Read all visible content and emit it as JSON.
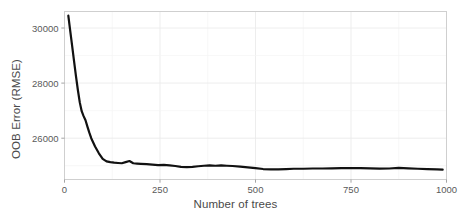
{
  "chart_data": {
    "type": "line",
    "title": "",
    "xlabel": "Number of trees",
    "ylabel": "OOB Error (RMSE)",
    "xlim": [
      0,
      1000
    ],
    "ylim": [
      24500,
      30600
    ],
    "xticks": [
      0,
      250,
      500,
      750,
      1000
    ],
    "xticklabels": [
      "0",
      "250",
      "500",
      "750",
      "1000"
    ],
    "yticks": [
      26000,
      28000,
      30000
    ],
    "yticklabels": [
      "26000",
      "28000",
      "30000"
    ],
    "grid": true,
    "legend": false,
    "line_color": "#111111",
    "line_width": 2.2,
    "panel_background": "#ffffff",
    "grid_color": "#ebebeb",
    "series": [
      {
        "name": "OOB Error",
        "x": [
          10,
          15,
          20,
          25,
          30,
          35,
          40,
          45,
          50,
          55,
          60,
          65,
          70,
          80,
          90,
          100,
          110,
          120,
          130,
          140,
          150,
          160,
          170,
          180,
          190,
          200,
          215,
          230,
          245,
          260,
          275,
          290,
          305,
          320,
          335,
          350,
          365,
          380,
          395,
          410,
          425,
          440,
          460,
          480,
          500,
          520,
          540,
          560,
          580,
          600,
          625,
          650,
          675,
          700,
          725,
          750,
          775,
          800,
          825,
          850,
          875,
          900,
          925,
          950,
          975,
          990
        ],
        "y": [
          30450,
          29900,
          29350,
          28800,
          28250,
          27750,
          27300,
          26980,
          26800,
          26650,
          26420,
          26200,
          26000,
          25700,
          25450,
          25250,
          25160,
          25130,
          25110,
          25100,
          25090,
          25130,
          25170,
          25090,
          25080,
          25070,
          25060,
          25040,
          25020,
          25030,
          25010,
          24990,
          24960,
          24950,
          24960,
          24980,
          25000,
          25010,
          25000,
          25010,
          25000,
          24990,
          24970,
          24940,
          24910,
          24880,
          24870,
          24870,
          24880,
          24890,
          24890,
          24900,
          24900,
          24905,
          24910,
          24915,
          24910,
          24905,
          24895,
          24900,
          24920,
          24905,
          24890,
          24880,
          24865,
          24855
        ]
      }
    ]
  },
  "ylabel_text": "OOB Error (RMSE)",
  "xlabel_text": "Number of trees"
}
